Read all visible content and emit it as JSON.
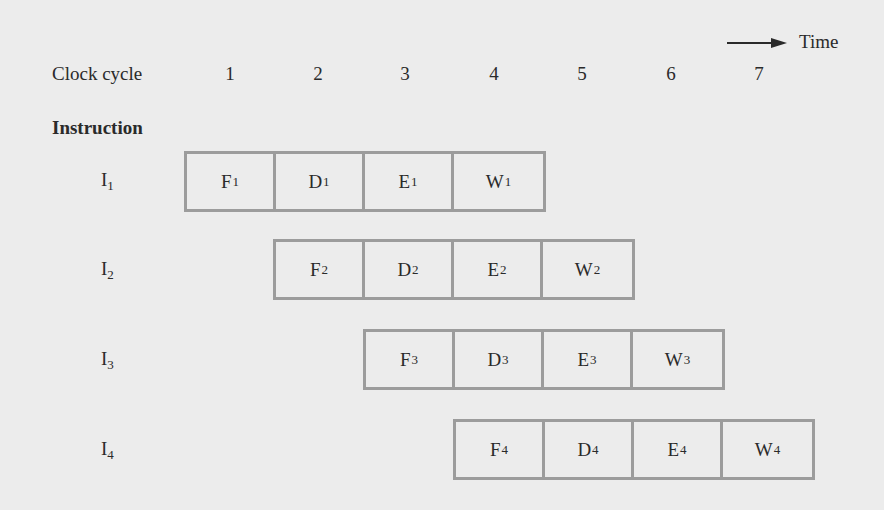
{
  "axis": {
    "cycle_label": "Clock cycle",
    "cycles": [
      "1",
      "2",
      "3",
      "4",
      "5",
      "6",
      "7"
    ],
    "time_label": "Time",
    "arrow_icon": "right-arrow"
  },
  "instruction_header": "Instruction",
  "stage_colors": {
    "border": "#9c9c9c",
    "background": "#ececec",
    "text": "#2a2a2a"
  },
  "instructions": [
    {
      "label": "I",
      "index": "1",
      "start_cycle": 1,
      "stages": [
        {
          "name": "F",
          "sub": "1"
        },
        {
          "name": "D",
          "sub": "1"
        },
        {
          "name": "E",
          "sub": "1"
        },
        {
          "name": "W",
          "sub": "1"
        }
      ]
    },
    {
      "label": "I",
      "index": "2",
      "start_cycle": 2,
      "stages": [
        {
          "name": "F",
          "sub": "2"
        },
        {
          "name": "D",
          "sub": "2"
        },
        {
          "name": "E",
          "sub": "2"
        },
        {
          "name": "W",
          "sub": "2"
        }
      ]
    },
    {
      "label": "I",
      "index": "3",
      "start_cycle": 3,
      "stages": [
        {
          "name": "F",
          "sub": "3"
        },
        {
          "name": "D",
          "sub": "3"
        },
        {
          "name": "E",
          "sub": "3"
        },
        {
          "name": "W",
          "sub": "3"
        }
      ]
    },
    {
      "label": "I",
      "index": "4",
      "start_cycle": 4,
      "stages": [
        {
          "name": "F",
          "sub": "4"
        },
        {
          "name": "D",
          "sub": "4"
        },
        {
          "name": "E",
          "sub": "4"
        },
        {
          "name": "W",
          "sub": "4"
        }
      ]
    }
  ]
}
